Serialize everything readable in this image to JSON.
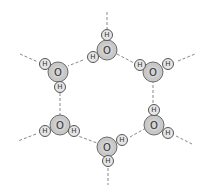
{
  "diagram": {
    "oxygen_label": "O",
    "hydrogen_label": "H",
    "colors": {
      "oxygen_fill": "#c8c8c8",
      "hydrogen_fill": "#e6e6e6",
      "bond": "#888888"
    },
    "molecules": [
      {
        "name": "top",
        "o": [
          107,
          50
        ],
        "h": [
          [
            107,
            35
          ],
          [
            93,
            57
          ]
        ]
      },
      {
        "name": "upper-left",
        "o": [
          58,
          72
        ],
        "h": [
          [
            45,
            64
          ],
          [
            60,
            87
          ]
        ]
      },
      {
        "name": "upper-right",
        "o": [
          153,
          72
        ],
        "h": [
          [
            140,
            65
          ],
          [
            168,
            64
          ]
        ]
      },
      {
        "name": "lower-right",
        "o": [
          154,
          125
        ],
        "h": [
          [
            154,
            110
          ],
          [
            168,
            133
          ]
        ]
      },
      {
        "name": "lower-left",
        "o": [
          60,
          125
        ],
        "h": [
          [
            45,
            131
          ],
          [
            74,
            131
          ]
        ]
      },
      {
        "name": "bottom",
        "o": [
          107,
          147
        ],
        "h": [
          [
            122,
            140
          ],
          [
            108,
            161
          ]
        ]
      }
    ],
    "hydrogen_bonds": [
      [
        107,
        12,
        107,
        29
      ],
      [
        83,
        60,
        68,
        66
      ],
      [
        117,
        54,
        134,
        63
      ],
      [
        60,
        93,
        60,
        115
      ],
      [
        153,
        80,
        153,
        104
      ],
      [
        70,
        133,
        97,
        143
      ],
      [
        130,
        137,
        146,
        128
      ],
      [
        20,
        54,
        38,
        62
      ],
      [
        178,
        61,
        195,
        54
      ],
      [
        176,
        136,
        192,
        144
      ],
      [
        36,
        134,
        18,
        141
      ],
      [
        108,
        168,
        108,
        185
      ]
    ]
  }
}
